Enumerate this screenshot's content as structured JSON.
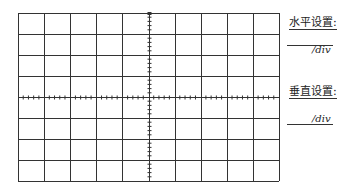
{
  "oscilloscope_screen": {
    "grid": {
      "left": 18,
      "top": 13,
      "right": 279,
      "bottom": 181,
      "columns": 10,
      "rows": 8,
      "line_color": "#333333",
      "center_x_tick_divisions": 5,
      "center_y_tick_divisions": 5
    }
  },
  "settings_panel": {
    "horizontal": {
      "label": "水平设置:",
      "value": "",
      "unit": "/div"
    },
    "vertical": {
      "label": "垂直设置:",
      "value": "",
      "unit": "/div"
    }
  }
}
